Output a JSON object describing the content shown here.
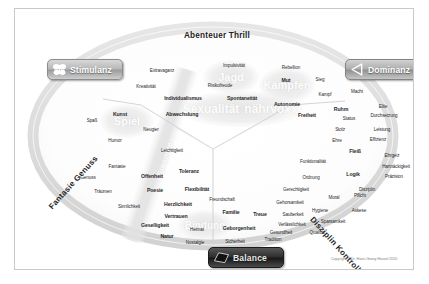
{
  "diagram": {
    "copyright": "Copyright © Dr. Hans-Georg Häusel 2010"
  },
  "axes": {
    "top": "Abenteuer Thrill",
    "bottom_left": "Fantasie Genuss",
    "bottom_right": "Disziplin Kontrolle"
  },
  "badges": [
    {
      "id": "stimulanz",
      "label": "Stimulanz",
      "icon": "butterfly-icon",
      "color": "#b7b7b7"
    },
    {
      "id": "dominanz",
      "label": "Dominanz",
      "icon": "triangle-left-icon",
      "color": "#adadad"
    },
    {
      "id": "balance",
      "label": "Balance",
      "icon": "quadrilateral-icon",
      "color": "#2e2e2e"
    }
  ],
  "instincts": [
    {
      "label": "Jagd",
      "x": 216,
      "y": 68,
      "size": 11
    },
    {
      "label": "Kämpfen",
      "x": 272,
      "y": 76,
      "size": 11
    },
    {
      "label": "Spiel",
      "x": 112,
      "y": 112,
      "size": 11
    },
    {
      "label": "Sexualität",
      "x": 196,
      "y": 100,
      "size": 12
    },
    {
      "label": "nährvoxx",
      "x": 256,
      "y": 100,
      "size": 12
    },
    {
      "label": "Bindung",
      "x": 190,
      "y": 216,
      "size": 10
    },
    {
      "label": "Fürsorge",
      "x": 150,
      "y": 150,
      "size": 8,
      "rotate": -72
    }
  ],
  "words": [
    {
      "t": "Extravaganz",
      "x": 147,
      "y": 61,
      "c": "sm"
    },
    {
      "t": "Impulsivität",
      "x": 219,
      "y": 56,
      "c": "sm"
    },
    {
      "t": "Rebellion",
      "x": 276,
      "y": 58,
      "c": "sm"
    },
    {
      "t": "Kreativität",
      "x": 131,
      "y": 77,
      "c": "sm"
    },
    {
      "t": "Risikofreude",
      "x": 205,
      "y": 76,
      "c": "sm"
    },
    {
      "t": "Mut",
      "x": 271,
      "y": 71,
      "c": "md"
    },
    {
      "t": "Sieg",
      "x": 305,
      "y": 70,
      "c": "sm"
    },
    {
      "t": "Kampf",
      "x": 310,
      "y": 85,
      "c": "sm"
    },
    {
      "t": "Macht",
      "x": 342,
      "y": 82,
      "c": "sm"
    },
    {
      "t": "Individualismus",
      "x": 168,
      "y": 89,
      "c": "md"
    },
    {
      "t": "Spontaneität",
      "x": 227,
      "y": 89,
      "c": "md"
    },
    {
      "t": "Autonomie",
      "x": 272,
      "y": 95,
      "c": "md"
    },
    {
      "t": "Elite",
      "x": 368,
      "y": 97,
      "c": "sm"
    },
    {
      "t": "Durchsetzung",
      "x": 369,
      "y": 106,
      "c": "sm"
    },
    {
      "t": "Abwechslung",
      "x": 167,
      "y": 105,
      "c": "md"
    },
    {
      "t": "Freiheit",
      "x": 292,
      "y": 106,
      "c": "md"
    },
    {
      "t": "Ruhm",
      "x": 326,
      "y": 100,
      "c": "md"
    },
    {
      "t": "Status",
      "x": 334,
      "y": 109,
      "c": "sm"
    },
    {
      "t": "Kunst",
      "x": 105,
      "y": 105,
      "c": "md"
    },
    {
      "t": "Spaß",
      "x": 77,
      "y": 111,
      "c": "sm"
    },
    {
      "t": "Stolz",
      "x": 325,
      "y": 120,
      "c": "sm"
    },
    {
      "t": "Leistung",
      "x": 367,
      "y": 120,
      "c": "sm"
    },
    {
      "t": "Neugier",
      "x": 136,
      "y": 120,
      "c": "sm"
    },
    {
      "t": "Ehre",
      "x": 322,
      "y": 131,
      "c": "sm"
    },
    {
      "t": "Effizienz",
      "x": 363,
      "y": 130,
      "c": "sm"
    },
    {
      "t": "Humor",
      "x": 100,
      "y": 131,
      "c": "sm"
    },
    {
      "t": "Fleiß",
      "x": 340,
      "y": 142,
      "c": "md"
    },
    {
      "t": "Ehrgeiz",
      "x": 377,
      "y": 146,
      "c": "sm"
    },
    {
      "t": "Leichtigkeit",
      "x": 157,
      "y": 141,
      "c": "sm"
    },
    {
      "t": "Funktionalität",
      "x": 298,
      "y": 152,
      "c": "sm"
    },
    {
      "t": "Hartnäckigkeit",
      "x": 381,
      "y": 157,
      "c": "sm"
    },
    {
      "t": "Fantasie",
      "x": 102,
      "y": 157,
      "c": "sm"
    },
    {
      "t": "Toleranz",
      "x": 174,
      "y": 162,
      "c": "md"
    },
    {
      "t": "Ordnung",
      "x": 296,
      "y": 168,
      "c": "sm"
    },
    {
      "t": "Logik",
      "x": 338,
      "y": 165,
      "c": "md"
    },
    {
      "t": "Genuss",
      "x": 73,
      "y": 168,
      "c": "sm"
    },
    {
      "t": "Offenheit",
      "x": 137,
      "y": 167,
      "c": "md"
    },
    {
      "t": "Präzision",
      "x": 379,
      "y": 167,
      "c": "sm"
    },
    {
      "t": "Gerechtigkeit",
      "x": 281,
      "y": 180,
      "c": "sm"
    },
    {
      "t": "Disziplin",
      "x": 352,
      "y": 180,
      "c": "sm"
    },
    {
      "t": "Träumen",
      "x": 88,
      "y": 182,
      "c": "sm"
    },
    {
      "t": "Poesie",
      "x": 140,
      "y": 181,
      "c": "md"
    },
    {
      "t": "Flexibilität",
      "x": 182,
      "y": 180,
      "c": "md"
    },
    {
      "t": "Moral",
      "x": 319,
      "y": 188,
      "c": "sm"
    },
    {
      "t": "Pflicht",
      "x": 345,
      "y": 186,
      "c": "sm"
    },
    {
      "t": "Freundschaft",
      "x": 207,
      "y": 190,
      "c": "sm"
    },
    {
      "t": "Gehorsamkeit",
      "x": 275,
      "y": 193,
      "c": "sm"
    },
    {
      "t": "Herzlichkeit",
      "x": 163,
      "y": 195,
      "c": "md"
    },
    {
      "t": "Sinnlichkeit",
      "x": 114,
      "y": 197,
      "c": "sm"
    },
    {
      "t": "Hygiene",
      "x": 305,
      "y": 201,
      "c": "sm"
    },
    {
      "t": "Askese",
      "x": 344,
      "y": 201,
      "c": "sm"
    },
    {
      "t": "Familie",
      "x": 216,
      "y": 203,
      "c": "md"
    },
    {
      "t": "Treue",
      "x": 245,
      "y": 205,
      "c": "md"
    },
    {
      "t": "Sauberkeit",
      "x": 278,
      "y": 205,
      "c": "sm"
    },
    {
      "t": "Vertrauen",
      "x": 161,
      "y": 207,
      "c": "md"
    },
    {
      "t": "Sparsamkeit",
      "x": 318,
      "y": 212,
      "c": "sm"
    },
    {
      "t": "Verlässlichkeit",
      "x": 277,
      "y": 215,
      "c": "sm"
    },
    {
      "t": "Geselligkeit",
      "x": 140,
      "y": 216,
      "c": "md"
    },
    {
      "t": "Heimat",
      "x": 182,
      "y": 220,
      "c": "sm"
    },
    {
      "t": "Geborgenheit",
      "x": 224,
      "y": 219,
      "c": "md"
    },
    {
      "t": "Gesundheit",
      "x": 266,
      "y": 223,
      "c": "sm"
    },
    {
      "t": "Qualität",
      "x": 302,
      "y": 223,
      "c": "sm"
    },
    {
      "t": "Natur",
      "x": 152,
      "y": 227,
      "c": "md"
    },
    {
      "t": "Nostalgie",
      "x": 180,
      "y": 233,
      "c": "sm"
    },
    {
      "t": "Sicherheit",
      "x": 220,
      "y": 232,
      "c": "sm"
    },
    {
      "t": "Tradition",
      "x": 258,
      "y": 230,
      "c": "sm"
    }
  ]
}
